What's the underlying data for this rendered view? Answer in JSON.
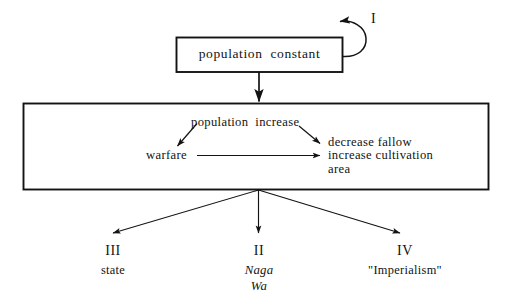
{
  "diagram": {
    "ink_color": "#131313",
    "background_color": "#ffffff",
    "boxes": [
      {
        "id": "top",
        "label": "population  constant"
      },
      {
        "id": "middle",
        "label": ""
      }
    ],
    "loop": {
      "label": "I"
    },
    "inner": {
      "population_increase": "population  increase",
      "warfare": "warfare",
      "right_lines": [
        "decrease fallow",
        "increase cultivation",
        "area"
      ]
    },
    "outcomes": [
      {
        "numeral": "III",
        "label": "state",
        "italic": false
      },
      {
        "numeral": "II",
        "label": "Naga",
        "label2": "Wa",
        "italic": true
      },
      {
        "numeral": "IV",
        "label": "\"Imperialism\"",
        "italic": false
      }
    ]
  }
}
